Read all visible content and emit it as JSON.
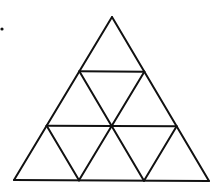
{
  "diagram": {
    "type": "subdivided-triangle",
    "rows": 3,
    "stroke_color": "#111111",
    "background": "#ffffff",
    "vertices": {
      "apex": [
        112,
        17
      ],
      "bottom_left": [
        14,
        180
      ],
      "bottom_right": [
        209,
        181
      ]
    },
    "marker_dot": [
      2,
      29
    ]
  }
}
